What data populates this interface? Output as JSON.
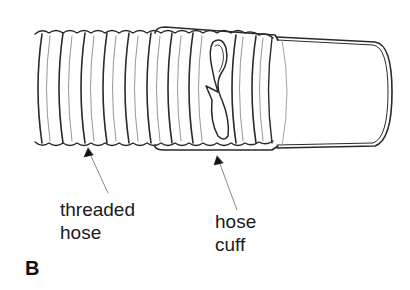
{
  "figure": {
    "letter": "B",
    "colors": {
      "line": "#2a2a2a",
      "thin_line": "#8a8a8a",
      "background": "#ffffff"
    }
  },
  "labels": {
    "threaded_hose": {
      "line1": "threaded",
      "line2": "hose"
    },
    "hose_cuff": {
      "line1": "hose",
      "line2": "cuff"
    }
  }
}
